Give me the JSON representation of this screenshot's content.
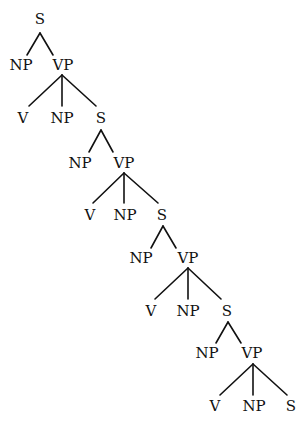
{
  "diagram": {
    "type": "syntax-tree",
    "colors": {
      "line": "#111111",
      "text": "#111111",
      "background": "#ffffff"
    },
    "nodes": [
      {
        "id": "s1",
        "label": "S",
        "x": 40,
        "y": 24
      },
      {
        "id": "np1",
        "label": "NP",
        "x": 21,
        "y": 70
      },
      {
        "id": "vp1",
        "label": "VP",
        "x": 63,
        "y": 70
      },
      {
        "id": "v1",
        "label": "V",
        "x": 23,
        "y": 123
      },
      {
        "id": "np2",
        "label": "NP",
        "x": 62,
        "y": 123
      },
      {
        "id": "s2",
        "label": "S",
        "x": 101,
        "y": 123
      },
      {
        "id": "np3",
        "label": "NP",
        "x": 80,
        "y": 168
      },
      {
        "id": "vp2",
        "label": "VP",
        "x": 124,
        "y": 168
      },
      {
        "id": "v2",
        "label": "V",
        "x": 90,
        "y": 220
      },
      {
        "id": "np4",
        "label": "NP",
        "x": 125,
        "y": 220
      },
      {
        "id": "s3",
        "label": "S",
        "x": 162,
        "y": 220
      },
      {
        "id": "np5",
        "label": "NP",
        "x": 141,
        "y": 263
      },
      {
        "id": "vp3",
        "label": "VP",
        "x": 188,
        "y": 263
      },
      {
        "id": "v3",
        "label": "V",
        "x": 151,
        "y": 316
      },
      {
        "id": "np6",
        "label": "NP",
        "x": 188,
        "y": 316
      },
      {
        "id": "s4",
        "label": "S",
        "x": 227,
        "y": 316
      },
      {
        "id": "np7",
        "label": "NP",
        "x": 207,
        "y": 358
      },
      {
        "id": "vp4",
        "label": "VP",
        "x": 252,
        "y": 358
      },
      {
        "id": "v4",
        "label": "V",
        "x": 215,
        "y": 411
      },
      {
        "id": "np8",
        "label": "NP",
        "x": 254,
        "y": 411
      },
      {
        "id": "s5",
        "label": "S",
        "x": 291,
        "y": 411
      }
    ],
    "edges": [
      {
        "x1": 40,
        "y1": 33,
        "x2": 27,
        "y2": 55
      },
      {
        "x1": 40,
        "y1": 33,
        "x2": 53,
        "y2": 55
      },
      {
        "x1": 62,
        "y1": 75,
        "x2": 29,
        "y2": 106
      },
      {
        "x1": 62,
        "y1": 75,
        "x2": 62,
        "y2": 106
      },
      {
        "x1": 62,
        "y1": 75,
        "x2": 96,
        "y2": 106
      },
      {
        "x1": 101,
        "y1": 130,
        "x2": 89,
        "y2": 152
      },
      {
        "x1": 101,
        "y1": 130,
        "x2": 113,
        "y2": 152
      },
      {
        "x1": 124,
        "y1": 173,
        "x2": 93,
        "y2": 203
      },
      {
        "x1": 124,
        "y1": 173,
        "x2": 124,
        "y2": 203
      },
      {
        "x1": 124,
        "y1": 173,
        "x2": 158,
        "y2": 203
      },
      {
        "x1": 163,
        "y1": 226,
        "x2": 151,
        "y2": 248
      },
      {
        "x1": 163,
        "y1": 226,
        "x2": 176,
        "y2": 248
      },
      {
        "x1": 188,
        "y1": 268,
        "x2": 155,
        "y2": 299
      },
      {
        "x1": 188,
        "y1": 268,
        "x2": 188,
        "y2": 299
      },
      {
        "x1": 188,
        "y1": 268,
        "x2": 221,
        "y2": 299
      },
      {
        "x1": 228,
        "y1": 322,
        "x2": 216,
        "y2": 343
      },
      {
        "x1": 228,
        "y1": 322,
        "x2": 241,
        "y2": 343
      },
      {
        "x1": 253,
        "y1": 364,
        "x2": 220,
        "y2": 395
      },
      {
        "x1": 253,
        "y1": 364,
        "x2": 253,
        "y2": 395
      },
      {
        "x1": 253,
        "y1": 364,
        "x2": 287,
        "y2": 395
      }
    ]
  }
}
